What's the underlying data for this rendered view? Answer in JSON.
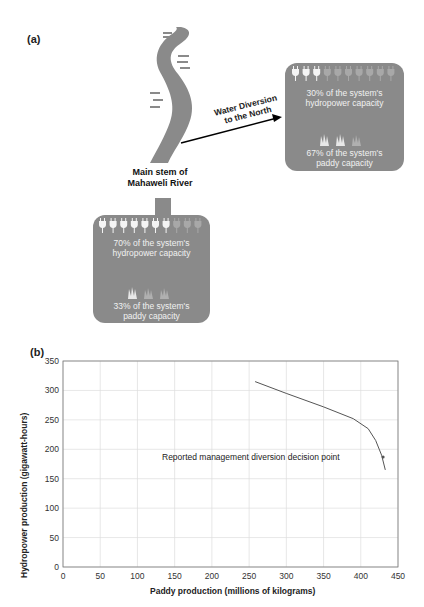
{
  "panel_a": {
    "label": "(a)",
    "river_label_line1": "Main stem of",
    "river_label_line2": "Mahaweli River",
    "diversion_label_line1": "Water Diversion",
    "diversion_label_line2": "to the North",
    "north_box": {
      "hydro_line1": "30% of the system's",
      "hydro_line2": "hydropower capacity",
      "paddy_line1": "67% of the system's",
      "paddy_line2": "paddy capacity",
      "plugs_filled": 3,
      "plugs_total": 10
    },
    "main_box": {
      "hydro_line1": "70% of the system's",
      "hydro_line2": "hydropower capacity",
      "paddy_line1": "33% of the system's",
      "paddy_line2": "paddy capacity",
      "plugs_filled": 7,
      "plugs_total": 10
    }
  },
  "panel_b": {
    "label": "(b)",
    "annotation": "Reported management diversion decision point"
  },
  "chart_data": {
    "type": "line",
    "title": "",
    "xlabel": "Paddy production (millions of kilograms)",
    "ylabel": "Hydropower production (gigawatt-hours)",
    "xlim": [
      0,
      450
    ],
    "ylim": [
      0,
      350
    ],
    "xticks": [
      0,
      50,
      100,
      150,
      200,
      250,
      300,
      350,
      400,
      450
    ],
    "yticks": [
      0,
      50,
      100,
      150,
      200,
      250,
      300,
      350
    ],
    "grid": true,
    "series": [
      {
        "name": "Hydropower vs paddy trade-off frontier",
        "x": [
          258,
          300,
          350,
          390,
          410,
          420,
          428,
          433
        ],
        "y": [
          315,
          295,
          272,
          252,
          235,
          215,
          190,
          165
        ]
      }
    ],
    "annotations": [
      {
        "text": "Reported management diversion decision point",
        "x": 430,
        "y": 187
      }
    ]
  }
}
